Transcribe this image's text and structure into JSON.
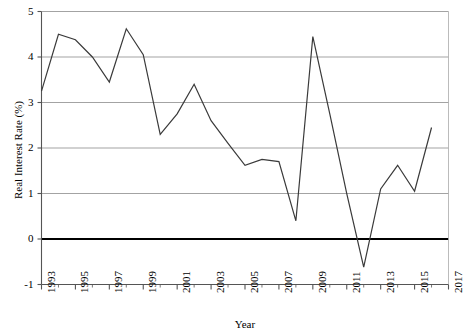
{
  "chart_data": {
    "type": "line",
    "title": "",
    "xlabel": "Year",
    "ylabel": "Real Interest Rate (%)",
    "xlim": [
      1993,
      2017
    ],
    "ylim": [
      -1,
      5
    ],
    "yticks": [
      -1,
      0,
      1,
      2,
      3,
      4,
      5
    ],
    "ytick_labels": [
      "-1",
      "0",
      "1",
      "2",
      "3",
      "4",
      "5"
    ],
    "xticks": [
      1993,
      1995,
      1997,
      1999,
      2001,
      2003,
      2005,
      2007,
      2009,
      2011,
      2013,
      2015,
      2017
    ],
    "xtick_labels": [
      "1993",
      "1995",
      "1997",
      "1999",
      "2001",
      "2003",
      "2005",
      "2007",
      "2009",
      "2011",
      "2013",
      "2015",
      "2017"
    ],
    "x_minor_tick_interval": 1,
    "grid": "horizontal",
    "grid_color": "#999999",
    "zero_line": true,
    "zero_line_color": "#000000",
    "legend": "none",
    "line_color": "#3a3a3a",
    "line_width": 1.2,
    "x": [
      1993,
      1994,
      1995,
      1996,
      1997,
      1998,
      1999,
      2000,
      2001,
      2002,
      2003,
      2004,
      2005,
      2006,
      2007,
      2008,
      2009,
      2010,
      2011,
      2012,
      2013,
      2014,
      2015,
      2016
    ],
    "values": [
      3.25,
      4.5,
      4.38,
      4.0,
      3.45,
      4.62,
      4.05,
      2.3,
      2.75,
      3.4,
      2.6,
      2.1,
      1.62,
      1.75,
      1.7,
      0.4,
      4.45,
      2.75,
      1.0,
      -0.62,
      1.1,
      1.62,
      1.05,
      2.45
    ],
    "series": [
      {
        "name": "Real Interest Rate",
        "values": [
          3.25,
          4.5,
          4.38,
          4.0,
          3.45,
          4.62,
          4.05,
          2.3,
          2.75,
          3.4,
          2.6,
          2.1,
          1.62,
          1.75,
          1.7,
          0.4,
          4.45,
          2.75,
          1.0,
          -0.62,
          1.1,
          1.62,
          1.05,
          2.45
        ]
      }
    ]
  },
  "axes": {
    "y_title": "Real Interest Rate (%)",
    "x_title": "Year"
  }
}
